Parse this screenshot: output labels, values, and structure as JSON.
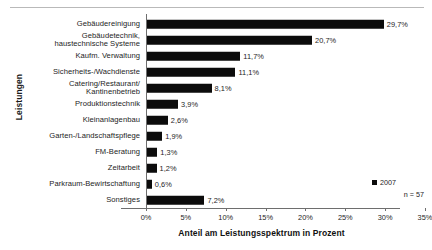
{
  "chart_data": {
    "type": "bar",
    "orientation": "horizontal",
    "title": "",
    "xlabel": "Anteil am Leistungsspektrum in Prozent",
    "ylabel": "Leistungen",
    "xlim": [
      0,
      35
    ],
    "xticks": [
      "0%",
      "5%",
      "10%",
      "15%",
      "20%",
      "25%",
      "30%",
      "35%"
    ],
    "xtick_values": [
      0,
      5,
      10,
      15,
      20,
      25,
      30,
      35
    ],
    "grid": false,
    "legend_position": "bottom-right",
    "bar_color": "#0c0c0c",
    "categories": [
      "Gebäudereinigung",
      "Gebäudetechnik,\nhaustechnische Systeme",
      "Kaufm. Verwaltung",
      "Sicherheits-/Wachdienste",
      "Catering/Restaurant/\nKantinenbetrieb",
      "Produktionstechnik",
      "Kleinanlagenbau",
      "Garten-/Landschaftspflege",
      "FM-Beratung",
      "Zeitarbeit",
      "Parkraum-Bewirtschaftung",
      "Sonstiges"
    ],
    "values": [
      29.7,
      20.7,
      11.7,
      11.1,
      8.1,
      3.9,
      2.6,
      1.9,
      1.3,
      1.2,
      0.6,
      7.2
    ],
    "value_labels": [
      "29,7%",
      "20,7%",
      "11,7%",
      "11,1%",
      "8,1%",
      "3,9%",
      "2,6%",
      "1,9%",
      "1,3%",
      "1,2%",
      "0,6%",
      "7,2%"
    ],
    "series": [
      {
        "name": "2007",
        "values": [
          29.7,
          20.7,
          11.7,
          11.1,
          8.1,
          3.9,
          2.6,
          1.9,
          1.3,
          1.2,
          0.6,
          7.2
        ]
      }
    ]
  },
  "legend": {
    "series_label": "2007",
    "sample_size": "n = 57"
  }
}
